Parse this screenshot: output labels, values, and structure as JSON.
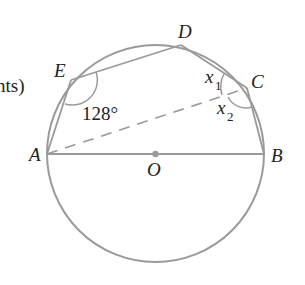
{
  "diagram": {
    "type": "circle-geometry",
    "fragment_text": "nts)",
    "circle": {
      "center_label": "O",
      "stroke_color": "#999999"
    },
    "points": [
      {
        "id": "A",
        "label": "A"
      },
      {
        "id": "B",
        "label": "B"
      },
      {
        "id": "C",
        "label": "C"
      },
      {
        "id": "D",
        "label": "D"
      },
      {
        "id": "E",
        "label": "E"
      },
      {
        "id": "O",
        "label": "O"
      }
    ],
    "segments": [
      {
        "from": "A",
        "to": "B",
        "style": "solid",
        "note": "diameter"
      },
      {
        "from": "A",
        "to": "E",
        "style": "solid"
      },
      {
        "from": "E",
        "to": "D",
        "style": "solid"
      },
      {
        "from": "D",
        "to": "C",
        "style": "solid"
      },
      {
        "from": "C",
        "to": "B",
        "style": "solid"
      },
      {
        "from": "A",
        "to": "C",
        "style": "dashed"
      }
    ],
    "angles": [
      {
        "vertex": "E",
        "label": "128°"
      },
      {
        "vertex": "C",
        "label": "x",
        "subscript": "1",
        "between": "DC-CA"
      },
      {
        "vertex": "C",
        "label": "x",
        "subscript": "2",
        "between": "CA-CB"
      }
    ]
  }
}
